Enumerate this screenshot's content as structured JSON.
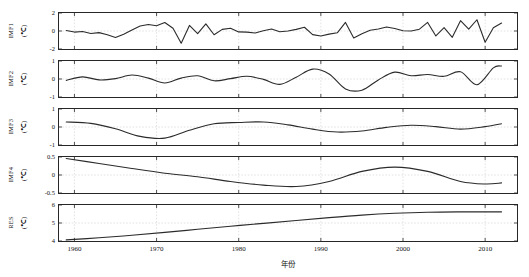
{
  "chart_data": {
    "type": "line",
    "title": "",
    "xlabel": "年份",
    "layout": {
      "panels": 5,
      "grid": true,
      "legend_position": "none",
      "shared_x": true,
      "xlim": [
        1958,
        2014
      ],
      "xticks": [
        1960,
        1970,
        1980,
        1990,
        2000,
        2010
      ],
      "xticklabels": [
        "1960",
        "1970",
        "1980",
        "1990",
        "2000",
        "2010"
      ],
      "line_color": "#2b2b2b",
      "axis_color": "#262626",
      "grid_color": "#d0d0d0",
      "background": "#ffffff"
    },
    "panels": [
      {
        "name": "IMF1",
        "ylabel": "IMF1",
        "yunit": "(℃)",
        "ylim": [
          -2,
          2
        ],
        "yticks": [
          2,
          0,
          -2
        ],
        "yticklabels": [
          "2",
          "0",
          "-2"
        ],
        "x": [
          1959,
          1960,
          1961,
          1962,
          1963,
          1964,
          1965,
          1966,
          1967,
          1968,
          1969,
          1970,
          1971,
          1972,
          1973,
          1974,
          1975,
          1976,
          1977,
          1978,
          1979,
          1980,
          1981,
          1982,
          1983,
          1984,
          1985,
          1986,
          1987,
          1988,
          1989,
          1990,
          1991,
          1992,
          1993,
          1994,
          1995,
          1996,
          1997,
          1998,
          1999,
          2000,
          2001,
          2002,
          2003,
          2004,
          2005,
          2006,
          2007,
          2008,
          2009,
          2010,
          2011,
          2012
        ],
        "values": [
          0.05,
          -0.12,
          -0.05,
          -0.28,
          -0.18,
          -0.42,
          -0.72,
          -0.35,
          0.12,
          0.55,
          0.72,
          0.58,
          0.95,
          0.3,
          -1.35,
          0.62,
          -0.3,
          0.8,
          -0.42,
          0.18,
          0.3,
          -0.1,
          -0.12,
          -0.22,
          0.02,
          0.22,
          -0.08,
          0.0,
          0.18,
          0.42,
          -0.4,
          -0.55,
          -0.35,
          -0.2,
          0.95,
          -0.78,
          -0.3,
          0.08,
          0.22,
          0.45,
          0.28,
          0.02,
          0.0,
          0.2,
          0.95,
          -0.55,
          0.38,
          -0.7,
          1.15,
          0.2,
          1.25,
          -1.25,
          0.35,
          0.88
        ]
      },
      {
        "name": "IMF2",
        "ylabel": "IMF2",
        "yunit": "(℃)",
        "ylim": [
          -1,
          1
        ],
        "yticks": [
          1,
          0,
          -1
        ],
        "yticklabels": [
          "1",
          "0",
          "-1"
        ],
        "x": [
          1959,
          1961,
          1963,
          1965,
          1967,
          1969,
          1971,
          1973,
          1975,
          1977,
          1979,
          1981,
          1983,
          1985,
          1987,
          1989,
          1991,
          1993,
          1995,
          1997,
          1999,
          2001,
          2003,
          2005,
          2007,
          2009,
          2011,
          2012
        ],
        "values": [
          -0.08,
          0.12,
          -0.05,
          0.02,
          0.22,
          0.05,
          -0.22,
          0.05,
          0.18,
          -0.1,
          0.02,
          0.15,
          -0.02,
          -0.3,
          0.1,
          0.55,
          0.28,
          -0.55,
          -0.62,
          -0.05,
          0.38,
          0.18,
          0.25,
          0.15,
          0.4,
          -0.32,
          0.62,
          0.72
        ]
      },
      {
        "name": "IMF3",
        "ylabel": "IMF3",
        "yunit": "(℃)",
        "ylim": [
          -1,
          1
        ],
        "yticks": [
          1,
          0,
          -1
        ],
        "yticklabels": [
          "1",
          "0",
          "-1"
        ],
        "x": [
          1959,
          1962,
          1965,
          1968,
          1971,
          1974,
          1977,
          1980,
          1983,
          1986,
          1989,
          1992,
          1995,
          1998,
          2001,
          2004,
          2007,
          2010,
          2012
        ],
        "values": [
          0.28,
          0.2,
          -0.1,
          -0.52,
          -0.62,
          -0.18,
          0.18,
          0.25,
          0.28,
          0.12,
          -0.12,
          -0.28,
          -0.22,
          -0.02,
          0.1,
          0.02,
          -0.12,
          0.02,
          0.18
        ]
      },
      {
        "name": "IMF4",
        "ylabel": "IMF4",
        "yunit": "(℃)",
        "ylim": [
          -0.5,
          0.5
        ],
        "yticks": [
          0.5,
          0,
          -0.5
        ],
        "yticklabels": [
          "0.5",
          "0",
          "-0.5"
        ],
        "x": [
          1959,
          1963,
          1967,
          1971,
          1975,
          1979,
          1983,
          1987,
          1991,
          1995,
          1999,
          2003,
          2007,
          2010,
          2012
        ],
        "values": [
          0.46,
          0.32,
          0.18,
          0.05,
          -0.05,
          -0.18,
          -0.28,
          -0.32,
          -0.18,
          0.1,
          0.22,
          0.1,
          -0.18,
          -0.25,
          -0.22
        ]
      },
      {
        "name": "RES",
        "ylabel": "RES",
        "yunit": "(℃)",
        "ylim": [
          4,
          6
        ],
        "yticks": [
          6,
          5,
          4
        ],
        "yticklabels": [
          "6",
          "5",
          "4"
        ],
        "x": [
          1959,
          1963,
          1967,
          1971,
          1975,
          1979,
          1983,
          1987,
          1991,
          1995,
          1999,
          2003,
          2007,
          2010,
          2012
        ],
        "values": [
          4.06,
          4.18,
          4.32,
          4.48,
          4.65,
          4.82,
          4.98,
          5.14,
          5.3,
          5.44,
          5.54,
          5.6,
          5.62,
          5.62,
          5.62
        ]
      }
    ]
  }
}
